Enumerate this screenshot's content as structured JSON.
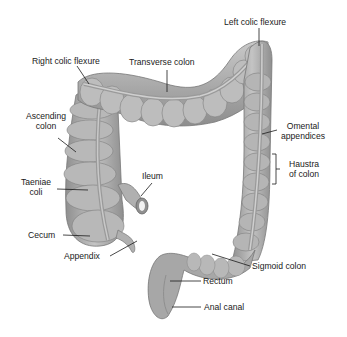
{
  "diagram": {
    "labels": {
      "left_colic_flexure": "Left colic flexure",
      "right_colic_flexure": "Right colic flexure",
      "transverse_colon": "Transverse colon",
      "ascending_colon_1": "Ascending",
      "ascending_colon_2": "colon",
      "omental_appendices_1": "Omental",
      "omental_appendices_2": "appendices",
      "haustra_1": "Haustra",
      "haustra_2": "of colon",
      "taeniae_coli_1": "Taeniae",
      "taeniae_coli_2": "coli",
      "ileum": "Ileum",
      "cecum": "Cecum",
      "appendix": "Appendix",
      "sigmoid_colon": "Sigmoid colon",
      "rectum": "Rectum",
      "anal_canal": "Anal canal"
    },
    "colors": {
      "organ_fill": "#a9a9a9",
      "organ_light": "#c8c8c8",
      "organ_dark": "#7a7a7a",
      "leader_line": "#1a1a1a"
    }
  }
}
